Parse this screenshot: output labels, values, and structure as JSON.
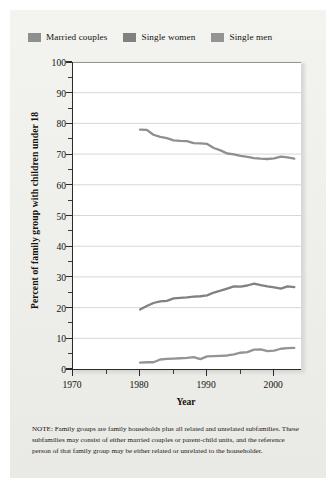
{
  "legend": {
    "items": [
      {
        "label": "Married couples",
        "color": "#8f8f8f",
        "swatch_name": "legend-swatch-married-couples"
      },
      {
        "label": "Single women",
        "color": "#818181",
        "swatch_name": "legend-swatch-single-women"
      },
      {
        "label": "Single men",
        "color": "#949494",
        "swatch_name": "legend-swatch-single-men"
      }
    ]
  },
  "axes": {
    "y_title": "Percent of family group with children under 18",
    "x_title": "Year",
    "y_ticks": [
      "0",
      "10",
      "20",
      "30",
      "40",
      "50",
      "60",
      "70",
      "80",
      "90",
      "100"
    ],
    "x_ticks": [
      "1970",
      "1980",
      "1990",
      "2000"
    ]
  },
  "note": {
    "text": "NOTE: Family groups are family households plus all related and unrelated subfamilies. These subfamilies may consist of either married couples or parent-child units, and the reference person of that family group may be either related or unrelated to the householder."
  },
  "chart_data": {
    "type": "line",
    "title": "",
    "xlabel": "Year",
    "ylabel": "Percent of family group with children under 18",
    "xlim": [
      1970,
      2004
    ],
    "ylim": [
      0,
      100
    ],
    "grid": true,
    "grid_axis": "y",
    "legend_position": "above-plot",
    "x": [
      1980,
      1981,
      1982,
      1983,
      1984,
      1985,
      1986,
      1987,
      1988,
      1989,
      1990,
      1991,
      1992,
      1993,
      1994,
      1995,
      1996,
      1997,
      1998,
      1999,
      2000,
      2001,
      2002,
      2003
    ],
    "series": [
      {
        "name": "Married couples",
        "color": "#8f8f8f",
        "values": [
          78.0,
          77.9,
          76.3,
          75.6,
          75.2,
          74.5,
          74.3,
          74.2,
          73.6,
          73.5,
          73.3,
          72.0,
          71.2,
          70.2,
          69.9,
          69.4,
          69.1,
          68.7,
          68.5,
          68.4,
          68.6,
          69.2,
          68.9,
          68.5
        ]
      },
      {
        "name": "Single women",
        "color": "#818181",
        "values": [
          19.4,
          20.5,
          21.5,
          22.0,
          22.2,
          23.0,
          23.2,
          23.3,
          23.6,
          23.7,
          24.0,
          24.9,
          25.5,
          26.2,
          26.9,
          26.8,
          27.2,
          27.8,
          27.3,
          26.9,
          26.6,
          26.2,
          26.9,
          26.7
        ]
      },
      {
        "name": "Single men",
        "color": "#949494",
        "values": [
          2.1,
          2.2,
          2.2,
          3.1,
          3.3,
          3.4,
          3.5,
          3.6,
          3.9,
          3.2,
          4.1,
          4.2,
          4.3,
          4.4,
          4.8,
          5.3,
          5.5,
          6.3,
          6.4,
          5.8,
          6.0,
          6.6,
          6.8,
          6.9
        ]
      }
    ]
  }
}
